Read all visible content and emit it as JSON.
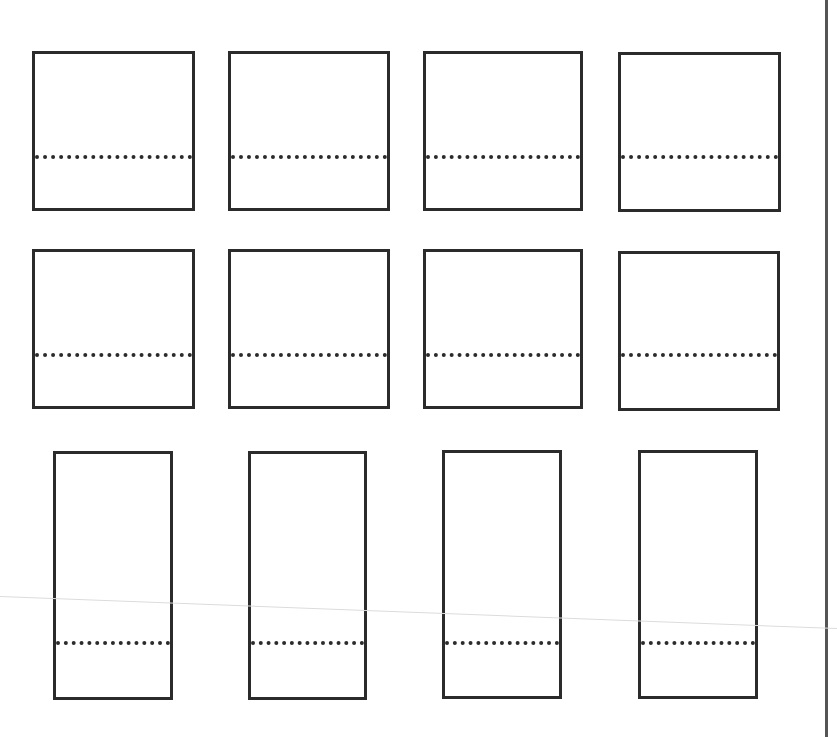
{
  "page": {
    "background": "#ffffff",
    "stroke_color": "#2b2b2b",
    "right_rule": {
      "x": 825,
      "color": "#555555"
    },
    "scan_line": {
      "x1": 0,
      "y1": 596,
      "x2": 837,
      "y2": 628,
      "color": "#dcdcdc"
    }
  },
  "rows": [
    {
      "label": "row-1",
      "boxes": [
        {
          "x": 32,
          "y": 51,
          "w": 163,
          "h": 160,
          "divider_y": 104
        },
        {
          "x": 228,
          "y": 51,
          "w": 162,
          "h": 160,
          "divider_y": 104
        },
        {
          "x": 423,
          "y": 51,
          "w": 160,
          "h": 160,
          "divider_y": 104
        },
        {
          "x": 618,
          "y": 52,
          "w": 163,
          "h": 160,
          "divider_y": 103
        }
      ]
    },
    {
      "label": "row-2",
      "boxes": [
        {
          "x": 32,
          "y": 249,
          "w": 163,
          "h": 160,
          "divider_y": 104
        },
        {
          "x": 228,
          "y": 249,
          "w": 162,
          "h": 160,
          "divider_y": 104
        },
        {
          "x": 423,
          "y": 249,
          "w": 160,
          "h": 160,
          "divider_y": 104
        },
        {
          "x": 618,
          "y": 251,
          "w": 162,
          "h": 160,
          "divider_y": 102
        }
      ]
    },
    {
      "label": "row-3",
      "boxes": [
        {
          "x": 53,
          "y": 451,
          "w": 120,
          "h": 249,
          "divider_y": 190
        },
        {
          "x": 248,
          "y": 451,
          "w": 119,
          "h": 249,
          "divider_y": 190
        },
        {
          "x": 442,
          "y": 450,
          "w": 120,
          "h": 249,
          "divider_y": 191
        },
        {
          "x": 638,
          "y": 450,
          "w": 120,
          "h": 249,
          "divider_y": 191
        }
      ]
    }
  ]
}
